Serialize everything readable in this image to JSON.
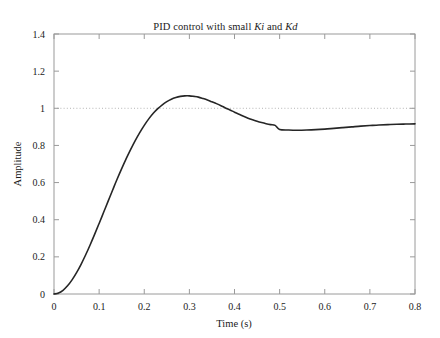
{
  "chart_data": {
    "type": "line",
    "title": "PID control with small Ki and Kd",
    "title_parts": {
      "prefix": "PID control with small ",
      "italic_1": "Ki",
      "middle": " and ",
      "italic_2": "Kd"
    },
    "xlabel": "Time (s)",
    "ylabel": "Amplitude",
    "xlim": [
      0,
      0.8
    ],
    "ylim": [
      0,
      1.4
    ],
    "xticks": [
      0,
      0.1,
      0.2,
      0.3,
      0.4,
      0.5,
      0.6,
      0.7,
      0.8
    ],
    "xtick_labels": [
      "0",
      "0.1",
      "0.2",
      "0.3",
      "0.4",
      "0.5",
      "0.6",
      "0.7",
      "0.8"
    ],
    "yticks": [
      0,
      0.2,
      0.4,
      0.6,
      0.8,
      1,
      1.2,
      1.4
    ],
    "ytick_labels": [
      "0",
      "0.2",
      "0.4",
      "0.6",
      "0.8",
      "1",
      "1.2",
      "1.4"
    ],
    "grid": false,
    "legend": null,
    "reference_line": {
      "name": "setpoint",
      "orientation": "horizontal",
      "value": 1,
      "style": "dotted",
      "color": "#b4b4b4"
    },
    "line_color": "#262626",
    "line_width": 1.6,
    "frame_color": "#9a9a9a",
    "background": "#ffffff",
    "features": {
      "peak_time": 0.23,
      "peak_value": 1.08,
      "trough_time": 0.46,
      "trough_value": 0.88,
      "final_value": 0.915,
      "initial_value": 0
    },
    "series": [
      {
        "name": "step response",
        "x": [
          0,
          0.01,
          0.02,
          0.03,
          0.04,
          0.05,
          0.06,
          0.07,
          0.08,
          0.09,
          0.1,
          0.11,
          0.12,
          0.13,
          0.14,
          0.15,
          0.16,
          0.17,
          0.18,
          0.19,
          0.2,
          0.21,
          0.22,
          0.23,
          0.24,
          0.25,
          0.26,
          0.27,
          0.28,
          0.29,
          0.3,
          0.31,
          0.32,
          0.33,
          0.34,
          0.35,
          0.36,
          0.37,
          0.38,
          0.39,
          0.4,
          0.41,
          0.42,
          0.43,
          0.44,
          0.45,
          0.46,
          0.47,
          0.48,
          0.49,
          0.5,
          0.52,
          0.54,
          0.56,
          0.58,
          0.6,
          0.62,
          0.64,
          0.66,
          0.68,
          0.7,
          0.72,
          0.74,
          0.76,
          0.78,
          0.8
        ],
        "y": [
          0.0,
          0.005,
          0.02,
          0.044,
          0.076,
          0.115,
          0.16,
          0.21,
          0.264,
          0.321,
          0.38,
          0.44,
          0.5,
          0.56,
          0.619,
          0.675,
          0.729,
          0.779,
          0.826,
          0.869,
          0.908,
          0.943,
          0.973,
          0.998,
          1.019,
          1.036,
          1.049,
          1.058,
          1.064,
          1.067,
          1.067,
          1.064,
          1.06,
          1.053,
          1.045,
          1.035,
          1.025,
          1.014,
          1.002,
          0.991,
          0.979,
          0.968,
          0.957,
          0.947,
          0.938,
          0.93,
          0.923,
          0.917,
          0.912,
          0.908,
          0.886,
          0.883,
          0.882,
          0.883,
          0.885,
          0.888,
          0.892,
          0.896,
          0.9,
          0.904,
          0.907,
          0.91,
          0.912,
          0.914,
          0.915,
          0.916
        ]
      }
    ]
  }
}
